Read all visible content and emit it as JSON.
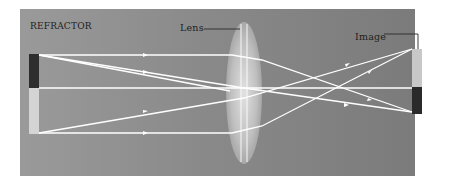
{
  "diagram": {
    "title": "REFRACTOR",
    "labels": {
      "lens": "Lens",
      "image": "Image"
    },
    "colors": {
      "background_left": "#9a9a9a",
      "background_right": "#7b7b7b",
      "ray": "#ffffff",
      "object_dark": "#2e2e2e",
      "object_light": "#d4d4d4",
      "image_light": "#c8c8c8",
      "image_dark": "#2a2a2a",
      "leader_line": "#2a2a2a"
    },
    "elements": {
      "object": "upright object (dark top half, light bottom half)",
      "lens": "biconvex lens",
      "image": "inverted real image (light top half, dark bottom half)",
      "rays": 6
    }
  }
}
